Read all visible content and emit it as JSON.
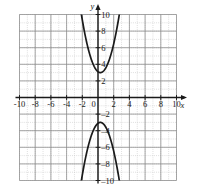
{
  "figure": {
    "kind": "coordinate-grid-graph",
    "background": "#ffffff",
    "grid_minor_color": "#c9c9c9",
    "grid_major_color": "#8a8a8a",
    "axis_color": "#1a1a1a",
    "curve_color": "#1a1a1a"
  },
  "axes": {
    "x_axis_label": "x",
    "y_axis_label": "y",
    "x_ticks": [
      "-10",
      "-8",
      "-6",
      "-4",
      "-2",
      "0",
      "2",
      "4",
      "6",
      "8",
      "10"
    ],
    "y_ticks_positive": [
      "2",
      "4",
      "6",
      "8",
      "10"
    ],
    "y_ticks_negative": [
      "2",
      "4",
      "6",
      "8",
      "10"
    ],
    "origin_label": "0"
  },
  "chart_data": {
    "type": "line",
    "title": "",
    "xlabel": "x",
    "ylabel": "y",
    "xlim": [
      -10,
      10
    ],
    "ylim": [
      -10,
      10
    ],
    "xtick_values": [
      -10,
      -8,
      -6,
      -4,
      -2,
      0,
      2,
      4,
      6,
      8,
      10
    ],
    "ytick_values": [
      -10,
      -8,
      -6,
      -4,
      -2,
      2,
      4,
      6,
      8,
      10
    ],
    "xtick_labels": [
      "-10",
      "-8",
      "-6",
      "-4",
      "-2",
      "0",
      "2",
      "4",
      "6",
      "8",
      "10"
    ],
    "ytick_labels": [
      "-10",
      "-8",
      "-6",
      "-4",
      "-2",
      "2",
      "4",
      "6",
      "8",
      "10"
    ],
    "grid": true,
    "minor_grid_step": 1,
    "major_grid_step": 2,
    "legend": "none",
    "series": [
      {
        "name": "upward-parabola",
        "equation": "y = 1.2(x - 0.3)^2 + 3",
        "opens": "up",
        "vertex": [
          0.3,
          3
        ],
        "a": 1.2,
        "x": [
          -2.1,
          -1.8,
          -1.5,
          -1.2,
          -0.9,
          -0.6,
          -0.3,
          0,
          0.3,
          0.6,
          0.9,
          1.2,
          1.5,
          1.8,
          2.1,
          2.4,
          2.7
        ],
        "values": [
          9.9,
          8.3,
          6.9,
          5.7,
          4.7,
          3.9,
          3.4,
          3.1,
          3.0,
          3.1,
          3.4,
          3.9,
          4.7,
          5.7,
          6.9,
          8.3,
          9.9
        ]
      },
      {
        "name": "downward-parabola",
        "equation": "y = -1.2(x - 0.3)^2 - 3",
        "opens": "down",
        "vertex": [
          0.3,
          -3
        ],
        "a": -1.2,
        "x": [
          -2.1,
          -1.8,
          -1.5,
          -1.2,
          -0.9,
          -0.6,
          -0.3,
          0,
          0.3,
          0.6,
          0.9,
          1.2,
          1.5,
          1.8,
          2.1,
          2.4,
          2.7
        ],
        "values": [
          -9.9,
          -8.3,
          -6.9,
          -5.7,
          -4.7,
          -3.9,
          -3.4,
          -3.1,
          -3.0,
          -3.1,
          -3.4,
          -3.9,
          -4.7,
          -5.7,
          -6.9,
          -8.3,
          -9.9
        ]
      }
    ]
  }
}
